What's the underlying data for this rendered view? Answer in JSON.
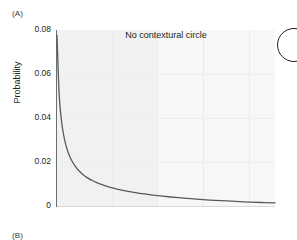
{
  "figure": {
    "panel_a_label": "(A)",
    "panel_b_label": "(B)"
  },
  "chart_data": {
    "type": "line",
    "title": "No contextural circle",
    "xlabel": "",
    "ylabel": "Probability",
    "ylim": [
      0,
      0.08
    ],
    "xlim": [
      0,
      100
    ],
    "y_ticks": [
      "0.08",
      "0.06",
      "0.04",
      "0.02",
      "0"
    ],
    "y_tick_values": [
      0.08,
      0.06,
      0.04,
      0.02,
      0
    ],
    "x_ticks": [],
    "grid": true,
    "legend": null,
    "series": [
      {
        "name": "Probability",
        "color": "#58595b",
        "x": [
          0,
          1,
          2,
          3,
          4,
          5,
          6,
          7,
          8,
          9,
          10,
          12,
          14,
          16,
          18,
          20,
          24,
          28,
          32,
          36,
          40,
          46,
          52,
          58,
          64,
          70,
          78,
          86,
          94,
          100
        ],
        "y": [
          0.0775,
          0.0505,
          0.0392,
          0.0325,
          0.028,
          0.0247,
          0.0222,
          0.0202,
          0.0186,
          0.0172,
          0.0161,
          0.0142,
          0.0128,
          0.0117,
          0.0107,
          0.0099,
          0.0086,
          0.0076,
          0.0068,
          0.0061,
          0.0055,
          0.0047,
          0.0041,
          0.0036,
          0.0031,
          0.0027,
          0.0023,
          0.0019,
          0.0016,
          0.0014
        ]
      }
    ],
    "annotations": [
      {
        "name": "contextual-circle-marker",
        "shape": "circle"
      }
    ]
  }
}
